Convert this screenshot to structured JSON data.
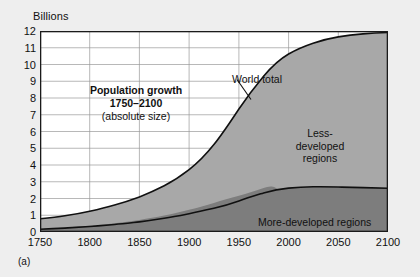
{
  "figure": {
    "panel_letter": "(a)",
    "y_axis_unit": "Billions",
    "callout_line1": "Population growth",
    "callout_line2": "1750–2100",
    "callout_line3": "(absolute size)",
    "series_label_world": "World total",
    "series_label_less_1": "Less-",
    "series_label_less_2": "developed",
    "series_label_less_3": "regions",
    "series_label_more": "More-developed regions"
  },
  "colors": {
    "page_background": "#eeeeee",
    "plot_background": "#ffffff",
    "gridline": "#9a9a9a",
    "axis_border": "#1a1a1a",
    "less_developed_fill": "#a8a8a8",
    "more_developed_fill": "#7d7d7d",
    "curve_stroke": "#101010",
    "text": "#111111"
  },
  "chart_data": {
    "type": "area",
    "xlabel": "",
    "ylabel": "Billions",
    "xlim": [
      1750,
      2100
    ],
    "ylim": [
      0,
      12
    ],
    "grid": true,
    "legend_position": "in-plot-annotations",
    "xticks": [
      1750,
      1800,
      1850,
      1900,
      1950,
      2000,
      2050,
      2100
    ],
    "xtick_labels": [
      "1750",
      "1800",
      "1850",
      "1900",
      "1950",
      "2000",
      "2050",
      "2100"
    ],
    "yticks": [
      0,
      1,
      2,
      3,
      4,
      5,
      6,
      7,
      8,
      9,
      10,
      11,
      12
    ],
    "ytick_labels": [
      "0",
      "1",
      "2",
      "3",
      "4",
      "5",
      "6",
      "7",
      "8",
      "9",
      "10",
      "11",
      "12"
    ],
    "x": [
      1750,
      1775,
      1800,
      1825,
      1850,
      1875,
      1900,
      1925,
      1950,
      1975,
      2000,
      2025,
      2050,
      2075,
      2100
    ],
    "series": [
      {
        "name": "More-developed regions",
        "stack_order": 1,
        "values": [
          0.17,
          0.2,
          0.24,
          0.28,
          0.34,
          0.43,
          0.55,
          0.7,
          0.81,
          1.05,
          1.19,
          1.27,
          1.28,
          1.26,
          1.24
        ]
      },
      {
        "name": "Less-developed regions",
        "stack_order": 2,
        "values": [
          0.62,
          0.68,
          0.76,
          0.87,
          0.98,
          1.12,
          1.32,
          1.6,
          1.87,
          3.02,
          4.87,
          6.75,
          8.0,
          9.0,
          9.9
        ]
      }
    ],
    "total_series": {
      "name": "World total",
      "values": [
        0.79,
        0.88,
        1.0,
        1.15,
        1.32,
        1.55,
        1.87,
        2.3,
        2.68,
        4.07,
        6.06,
        8.02,
        9.28,
        10.26,
        11.14
      ]
    },
    "annotations": [
      {
        "text": "Population growth",
        "x": 1838,
        "y": 8.2
      },
      {
        "text": "1750–2100",
        "x": 1838,
        "y": 7.5
      },
      {
        "text": "(absolute size)",
        "x": 1838,
        "y": 6.8
      },
      {
        "text": "World total",
        "x": 1963,
        "y": 9.6,
        "leader_to_x": 2003,
        "leader_to_y": 7.8
      },
      {
        "text": "Less-developed regions",
        "x": 2060,
        "y": 6.1
      },
      {
        "text": "More-developed regions",
        "x": 2055,
        "y": 1.3
      }
    ]
  }
}
